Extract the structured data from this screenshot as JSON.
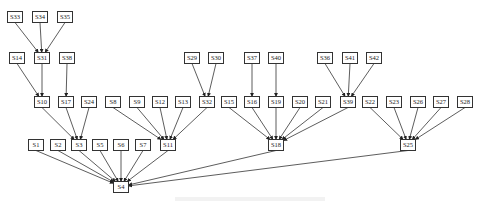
{
  "diagram": {
    "type": "directed-tree",
    "root": "S4",
    "node_size": {
      "w": 15,
      "h": 11
    },
    "nodes": [
      {
        "id": "S33",
        "x": 15,
        "y": 17
      },
      {
        "id": "S34",
        "x": 40,
        "y": 17
      },
      {
        "id": "S35",
        "x": 65,
        "y": 17
      },
      {
        "id": "S14",
        "x": 17,
        "y": 58
      },
      {
        "id": "S31",
        "x": 42,
        "y": 58
      },
      {
        "id": "S38",
        "x": 67,
        "y": 58
      },
      {
        "id": "S29",
        "x": 192,
        "y": 58
      },
      {
        "id": "S30",
        "x": 216,
        "y": 58
      },
      {
        "id": "S37",
        "x": 252,
        "y": 58
      },
      {
        "id": "S40",
        "x": 276,
        "y": 58
      },
      {
        "id": "S36",
        "x": 325,
        "y": 58
      },
      {
        "id": "S41",
        "x": 350,
        "y": 58
      },
      {
        "id": "S42",
        "x": 374,
        "y": 58
      },
      {
        "id": "S10",
        "x": 42,
        "y": 102
      },
      {
        "id": "S17",
        "x": 66,
        "y": 102
      },
      {
        "id": "S24",
        "x": 89,
        "y": 102
      },
      {
        "id": "S8",
        "x": 113,
        "y": 102
      },
      {
        "id": "S9",
        "x": 137,
        "y": 102
      },
      {
        "id": "S12",
        "x": 160,
        "y": 102
      },
      {
        "id": "S13",
        "x": 183,
        "y": 102
      },
      {
        "id": "S32",
        "x": 207,
        "y": 102
      },
      {
        "id": "S15",
        "x": 229,
        "y": 102
      },
      {
        "id": "S16",
        "x": 252,
        "y": 102
      },
      {
        "id": "S19",
        "x": 276,
        "y": 102
      },
      {
        "id": "S20",
        "x": 300,
        "y": 102
      },
      {
        "id": "S21",
        "x": 323,
        "y": 102
      },
      {
        "id": "S39",
        "x": 348,
        "y": 102
      },
      {
        "id": "S22",
        "x": 370,
        "y": 102
      },
      {
        "id": "S23",
        "x": 394,
        "y": 102
      },
      {
        "id": "S26",
        "x": 418,
        "y": 102
      },
      {
        "id": "S27",
        "x": 441,
        "y": 102
      },
      {
        "id": "S28",
        "x": 465,
        "y": 102
      },
      {
        "id": "S1",
        "x": 36,
        "y": 145
      },
      {
        "id": "S2",
        "x": 58,
        "y": 145
      },
      {
        "id": "S3",
        "x": 79,
        "y": 145
      },
      {
        "id": "S5",
        "x": 100,
        "y": 145
      },
      {
        "id": "S6",
        "x": 121,
        "y": 145
      },
      {
        "id": "S7",
        "x": 143,
        "y": 145
      },
      {
        "id": "S11",
        "x": 168,
        "y": 145
      },
      {
        "id": "S18",
        "x": 276,
        "y": 145
      },
      {
        "id": "S25",
        "x": 408,
        "y": 145
      },
      {
        "id": "S4",
        "x": 121,
        "y": 187
      }
    ],
    "edges": [
      [
        "S33",
        "S31"
      ],
      [
        "S34",
        "S31"
      ],
      [
        "S35",
        "S31"
      ],
      [
        "S14",
        "S10"
      ],
      [
        "S31",
        "S10"
      ],
      [
        "S38",
        "S17"
      ],
      [
        "S29",
        "S32"
      ],
      [
        "S30",
        "S32"
      ],
      [
        "S37",
        "S16"
      ],
      [
        "S40",
        "S19"
      ],
      [
        "S36",
        "S39"
      ],
      [
        "S41",
        "S39"
      ],
      [
        "S42",
        "S39"
      ],
      [
        "S10",
        "S3"
      ],
      [
        "S17",
        "S3"
      ],
      [
        "S24",
        "S3"
      ],
      [
        "S8",
        "S11"
      ],
      [
        "S9",
        "S11"
      ],
      [
        "S12",
        "S11"
      ],
      [
        "S13",
        "S11"
      ],
      [
        "S32",
        "S11"
      ],
      [
        "S15",
        "S18"
      ],
      [
        "S16",
        "S18"
      ],
      [
        "S19",
        "S18"
      ],
      [
        "S20",
        "S18"
      ],
      [
        "S21",
        "S18"
      ],
      [
        "S39",
        "S18"
      ],
      [
        "S22",
        "S25"
      ],
      [
        "S23",
        "S25"
      ],
      [
        "S26",
        "S25"
      ],
      [
        "S27",
        "S25"
      ],
      [
        "S28",
        "S25"
      ],
      [
        "S1",
        "S4"
      ],
      [
        "S2",
        "S4"
      ],
      [
        "S3",
        "S4"
      ],
      [
        "S5",
        "S4"
      ],
      [
        "S6",
        "S4"
      ],
      [
        "S7",
        "S4"
      ],
      [
        "S11",
        "S4"
      ],
      [
        "S18",
        "S4"
      ],
      [
        "S25",
        "S4"
      ]
    ]
  },
  "caption": {
    "text": "",
    "note": "faint caption text clipped at bottom edge, illegible"
  },
  "colors": {
    "stroke": "#333333",
    "background": "#ffffff",
    "caption": "#e4e4e4"
  }
}
